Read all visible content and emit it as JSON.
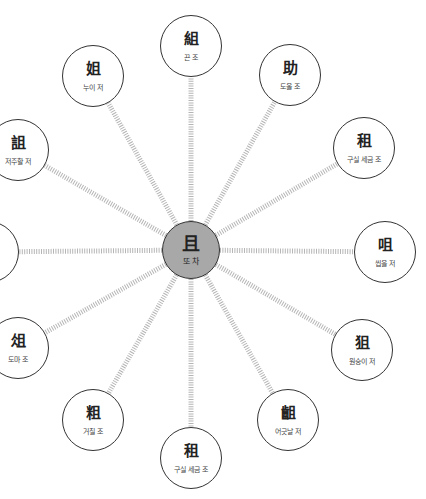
{
  "diagram": {
    "center": {
      "hanja": "且",
      "reading": "또 차",
      "x": 191,
      "y": 250,
      "r": 29,
      "fill": "#a8a8a8"
    },
    "nodes": [
      {
        "hanja": "組",
        "reading": "끈 조",
        "x": 191,
        "y": 46
      },
      {
        "hanja": "助",
        "reading": "도울 조",
        "x": 290,
        "y": 75
      },
      {
        "hanja": "租",
        "reading": "구실 세금 조",
        "x": 364,
        "y": 148
      },
      {
        "hanja": "咀",
        "reading": "씹을 저",
        "x": 385,
        "y": 252
      },
      {
        "hanja": "狙",
        "reading": "원숭이 저",
        "x": 362,
        "y": 350
      },
      {
        "hanja": "齟",
        "reading": "어긋날 저",
        "x": 288,
        "y": 420
      },
      {
        "hanja": "租",
        "reading": "구실 세금 조",
        "x": 191,
        "y": 458
      },
      {
        "hanja": "粗",
        "reading": "거칠 조",
        "x": 93,
        "y": 420
      },
      {
        "hanja": "俎",
        "reading": "도마 조",
        "x": 18,
        "y": 348
      },
      {
        "hanja": "",
        "reading": "",
        "x": -12,
        "y": 252
      },
      {
        "hanja": "詛",
        "reading": "저주할 저",
        "x": 18,
        "y": 150
      },
      {
        "hanja": "姐",
        "reading": "누이 저",
        "x": 93,
        "y": 76
      }
    ],
    "node_radius": 31,
    "link_color": "#b5b5b5"
  }
}
